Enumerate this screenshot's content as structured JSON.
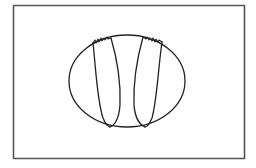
{
  "diagram": {
    "width": 256,
    "height": 168,
    "background": "#ffffff",
    "frame": {
      "x": 13.5,
      "y": 5.5,
      "width": 231,
      "height": 153,
      "stroke": "#555555",
      "stroke_width": 1.6
    },
    "outline": {
      "cx": 127,
      "cy": 81,
      "rx": 58,
      "ry": 46,
      "stroke": "#222222",
      "stroke_width": 1.3
    },
    "lobes": [
      {
        "name": "left-lobe",
        "outer_path": "M93,43 C96,70 97,100 103,118 C105,123 107,126 110,127",
        "inner_path": "M111,38 C116,55 121,80 120,105 C119,118 115,125 110,127",
        "serration_path": "M93,43 L95,40 L96,43 L98,39 L99,42 L101,38 L102,41 L104,38 L105,40 L107,37 L108,39 L111,38"
      },
      {
        "name": "right-lobe",
        "outer_path": "M162,42 C158,70 157,100 152,118 C150,123 148,126 145,127",
        "inner_path": "M143,37 C138,55 133,80 134,105 C135,118 140,125 145,127",
        "serration_path": "M143,37 L146,39 L147,37 L149,40 L150,38 L152,41 L153,38 L155,42 L156,39 L158,42 L159,40 L162,42"
      }
    ],
    "lobe_stroke": "#222222",
    "lobe_stroke_width": 1.3
  }
}
